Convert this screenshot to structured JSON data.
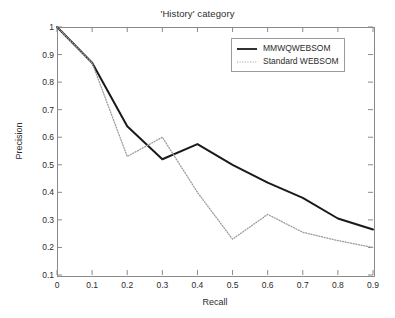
{
  "chart_data": {
    "type": "line",
    "title": "'History' category",
    "xlabel": "Recall",
    "ylabel": "Precision",
    "xlim": [
      0,
      0.9
    ],
    "ylim": [
      0.1,
      1
    ],
    "grid": false,
    "legend_position": "top-right",
    "xticks": [
      "0",
      "0.1",
      "0.2",
      "0.3",
      "0.4",
      "0.5",
      "0.6",
      "0.7",
      "0.8",
      "0.9"
    ],
    "yticks": [
      "0.1",
      "0.2",
      "0.3",
      "0.4",
      "0.5",
      "0.6",
      "0.7",
      "0.8",
      "0.9",
      "1"
    ],
    "x": [
      0,
      0.1,
      0.2,
      0.3,
      0.4,
      0.5,
      0.6,
      0.7,
      0.8,
      0.9
    ],
    "series": [
      {
        "name": "MMWQWEBSOM",
        "style": "solid",
        "color": "#1a1a1a",
        "values": [
          1.0,
          0.87,
          0.64,
          0.52,
          0.575,
          0.5,
          0.435,
          0.38,
          0.305,
          0.265
        ]
      },
      {
        "name": "Standard WEBSOM",
        "style": "dotted",
        "color": "#9b9b9b",
        "values": [
          1.0,
          0.87,
          0.53,
          0.6,
          0.4,
          0.23,
          0.32,
          0.255,
          0.225,
          0.2
        ]
      }
    ]
  },
  "legend": {
    "entries": [
      {
        "label": "MMWQWEBSOM"
      },
      {
        "label": "Standard WEBSOM"
      }
    ]
  }
}
